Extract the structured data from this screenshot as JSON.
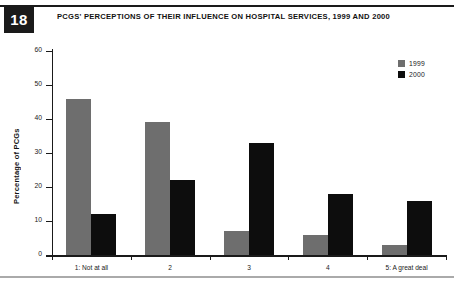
{
  "figure": {
    "number": "18",
    "title": "PCGS' PERCEPTIONS OF THEIR INFLUENCE ON HOSPITAL SERVICES, 1999 AND 2000"
  },
  "legend": {
    "position": "top-right",
    "entries": [
      {
        "label": "1999",
        "color": "#6e6e6e"
      },
      {
        "label": "2000",
        "color": "#0d0d0d"
      }
    ]
  },
  "chart_data": {
    "type": "bar",
    "title": "PCGS' PERCEPTIONS OF THEIR INFLUENCE ON HOSPITAL SERVICES, 1999 AND 2000",
    "xlabel": "",
    "ylabel": "Percentage of PCGs",
    "categories": [
      "1: Not at all",
      "2",
      "3",
      "4",
      "5: A great deal"
    ],
    "series": [
      {
        "name": "1999",
        "color": "#6e6e6e",
        "values": [
          46,
          39,
          7,
          6,
          3
        ]
      },
      {
        "name": "2000",
        "color": "#0d0d0d",
        "values": [
          12,
          22,
          33,
          18,
          16
        ]
      }
    ],
    "ylim": [
      0,
      60
    ],
    "yticks": [
      0,
      10,
      20,
      30,
      40,
      50,
      60
    ],
    "ytick_labels": [
      "0",
      "10",
      "20",
      "30",
      "40",
      "50",
      "60"
    ],
    "grid": false,
    "legend_position": "top-right"
  }
}
